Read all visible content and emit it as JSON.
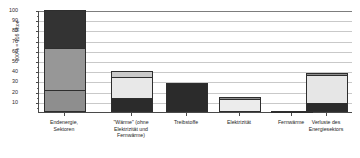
{
  "chart_data": {
    "type": "bar",
    "title": "",
    "subtitle": "",
    "xlabel": "",
    "ylabel": "100% = 116 Mtoe",
    "ylim": [
      0,
      100
    ],
    "yticks": [
      0,
      10,
      20,
      30,
      40,
      50,
      60,
      70,
      80,
      90,
      100
    ],
    "ytick_labels": [
      "0",
      "10",
      "20",
      "30",
      "40",
      "50",
      "60",
      "70",
      "80",
      "90",
      "100"
    ],
    "grid": true,
    "grid_axis": "y",
    "legend": false,
    "legend_position": "none",
    "stacked": true,
    "categories": [
      "Endenergie,\nSektoren",
      "\"Wärme\" (ohne\nElektrizität und\nFernwärme)",
      "Treibstoffe",
      "Elektrizität",
      "Fernwärme",
      "Verluste des\nEnergiesektors"
    ],
    "values": [
      100,
      40,
      28,
      15,
      1,
      38
    ],
    "series": [
      {
        "name": "Segment unten",
        "values": [
          22,
          12,
          28,
          1.5,
          1,
          8
        ],
        "color": "#8c8c8c"
      },
      {
        "name": "Segment mitte",
        "values": [
          41,
          22,
          0,
          13.5,
          0,
          29
        ],
        "color": "#9a9a9a"
      },
      {
        "name": "Segment oben",
        "values": [
          37,
          6,
          0,
          0,
          0,
          1
        ],
        "color": "#333333"
      }
    ],
    "bars": [
      {
        "category": "Endenergie, Sektoren",
        "total": 100,
        "segments": [
          {
            "label": "oben",
            "from": 63,
            "to": 100,
            "value": 37,
            "color": "#333333"
          },
          {
            "label": "mitte",
            "from": 22,
            "to": 63,
            "value": 41,
            "color": "#979797"
          },
          {
            "label": "unten",
            "from": 0,
            "to": 22,
            "value": 22,
            "color": "#8e8e8e"
          }
        ]
      },
      {
        "category": "\"Wärme\" (ohne Elektrizität und Fernwärme)",
        "total": 40,
        "segments": [
          {
            "label": "oben",
            "from": 34,
            "to": 40,
            "value": 6,
            "color": "#c9c9c9"
          },
          {
            "label": "mitte",
            "from": 14,
            "to": 34,
            "value": 20,
            "color": "#e8e8e8"
          },
          {
            "label": "unten",
            "from": 0,
            "to": 14,
            "value": 14,
            "color": "#2b2b2b"
          }
        ]
      },
      {
        "category": "Treibstoffe",
        "total": 28,
        "segments": [
          {
            "label": "voll",
            "from": 0,
            "to": 28,
            "value": 28,
            "color": "#2b2b2b"
          }
        ]
      },
      {
        "category": "Elektrizität",
        "total": 15,
        "segments": [
          {
            "label": "oben",
            "from": 13,
            "to": 15,
            "value": 2,
            "color": "#8e8e8e"
          },
          {
            "label": "unten",
            "from": 0,
            "to": 13,
            "value": 13,
            "color": "#ececec"
          }
        ]
      },
      {
        "category": "Fernwärme",
        "total": 1,
        "segments": [
          {
            "label": "voll",
            "from": 0,
            "to": 1,
            "value": 1,
            "color": "#6e6e6e"
          }
        ]
      },
      {
        "category": "Verluste des Energiesektors",
        "total": 38,
        "segments": [
          {
            "label": "oben",
            "from": 36,
            "to": 38,
            "value": 2,
            "color": "#8e8e8e"
          },
          {
            "label": "mitte",
            "from": 9,
            "to": 36,
            "value": 27,
            "color": "#e6e6e6"
          },
          {
            "label": "unten",
            "from": 0,
            "to": 9,
            "value": 9,
            "color": "#2b2b2b"
          }
        ]
      }
    ]
  },
  "axis": {
    "y_title": "100% = 116 Mtoe",
    "tick_labels": [
      "100",
      "90",
      "80",
      "70",
      "60",
      "50",
      "40",
      "30",
      "20",
      "10"
    ]
  },
  "categories_display": [
    "Endenergie,\nSektoren",
    "\"Wärme\" (ohne\nElektrizität und\nFernwärme)",
    "Treibstoffe",
    "Elektrizität",
    "Fernwärme",
    "Verluste des\nEnergiesektors"
  ]
}
